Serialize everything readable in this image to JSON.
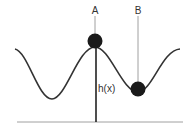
{
  "diagram": {
    "title": "",
    "labels": {
      "point_a": "A",
      "point_b": "B",
      "height": "h(x)"
    },
    "colors": {
      "curve": "#333333",
      "ball": "#1a1a1a",
      "leader": "#888888",
      "baseline": "#999999",
      "background": "#ffffff"
    },
    "elements": [
      {
        "id": "curve",
        "type": "sinusoidal wave with peak at A and trough at B"
      },
      {
        "id": "ball-a",
        "type": "ball resting on peak",
        "label": "A"
      },
      {
        "id": "ball-b",
        "type": "ball resting in trough",
        "label": "B"
      },
      {
        "id": "height-line",
        "type": "vertical line from ground to peak",
        "label": "h(x)"
      },
      {
        "id": "ground",
        "type": "horizontal baseline"
      }
    ]
  }
}
